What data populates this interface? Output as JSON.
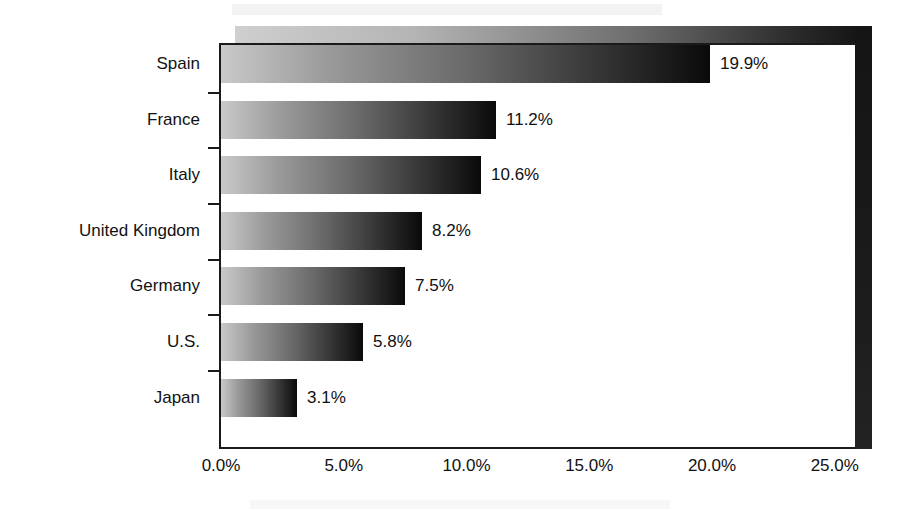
{
  "chart_data": {
    "type": "bar",
    "orientation": "horizontal",
    "title": "",
    "subtitle": "",
    "xlabel": "",
    "ylabel": "",
    "categories": [
      "Spain",
      "France",
      "Italy",
      "United Kingdom",
      "Germany",
      "U.S.",
      "Japan"
    ],
    "values": [
      19.9,
      11.2,
      10.6,
      8.2,
      7.5,
      5.8,
      3.1
    ],
    "value_labels": [
      "19.9%",
      "11.2%",
      "10.6%",
      "8.2%",
      "7.5%",
      "5.8%",
      "3.1%"
    ],
    "xlim": [
      0,
      25
    ],
    "x_tick_values": [
      0,
      5,
      10,
      15,
      20,
      25
    ],
    "x_tick_labels": [
      "0.0%",
      "5.0%",
      "10.0%",
      "15.0%",
      "20.0%",
      "25.0%"
    ],
    "grid": false,
    "legend": false,
    "legend_position": "none",
    "bar_fill": "gradient-light-gray-to-black",
    "bar_gradient_start": "#c9c9c9",
    "bar_gradient_end": "#0a0a0a",
    "plot_border_color": "#1a1a1a",
    "wall_shadow_color": "#1a1a1a",
    "background_color": "#ffffff",
    "text_color": "#111111"
  },
  "bars": [
    {
      "category": "Spain",
      "value": 19.9,
      "label": "19.9%"
    },
    {
      "category": "France",
      "value": 11.2,
      "label": "11.2%"
    },
    {
      "category": "Italy",
      "value": 10.6,
      "label": "10.6%"
    },
    {
      "category": "United Kingdom",
      "value": 8.2,
      "label": "8.2%"
    },
    {
      "category": "Germany",
      "value": 7.5,
      "label": "7.5%"
    },
    {
      "category": "U.S.",
      "value": 5.8,
      "label": "5.8%"
    },
    {
      "category": "Japan",
      "value": 3.1,
      "label": "3.1%"
    }
  ],
  "x_axis": {
    "ticks": [
      {
        "value": 0,
        "label": "0.0%"
      },
      {
        "value": 5,
        "label": "5.0%"
      },
      {
        "value": 10,
        "label": "10.0%"
      },
      {
        "value": 15,
        "label": "15.0%"
      },
      {
        "value": 20,
        "label": "20.0%"
      },
      {
        "value": 25,
        "label": "25.0%"
      }
    ]
  }
}
